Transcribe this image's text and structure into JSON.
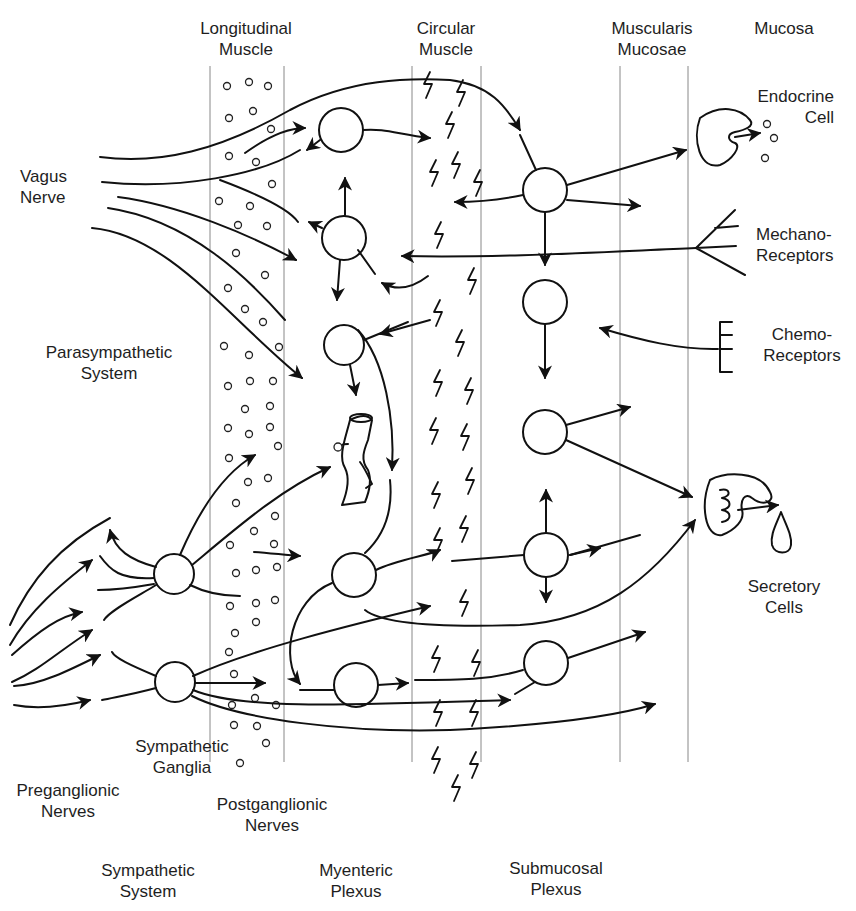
{
  "diagram": {
    "layers": [
      {
        "id": "longitudinal",
        "label_line1": "Longitudinal",
        "label_line2": "Muscle"
      },
      {
        "id": "circular",
        "label_line1": "Circular",
        "label_line2": "Muscle"
      },
      {
        "id": "muscularis",
        "label_line1": "Muscularis",
        "label_line2": "Mucosae"
      },
      {
        "id": "mucosa",
        "label_line1": "Mucosa",
        "label_line2": ""
      }
    ],
    "labels": {
      "vagus": {
        "line1": "Vagus",
        "line2": "Nerve"
      },
      "parasympathetic": {
        "line1": "Parasympathetic",
        "line2": "System"
      },
      "endocrine": {
        "line1": "Endocrine",
        "line2": "Cell"
      },
      "mechano": {
        "line1": "Mechano-",
        "line2": "Receptors"
      },
      "chemo": {
        "line1": "Chemo-",
        "line2": "Receptors"
      },
      "secretory": {
        "line1": "Secretory",
        "line2": "Cells"
      },
      "sympathetic_ganglia": {
        "line1": "Sympathetic",
        "line2": "Ganglia"
      },
      "preganglionic": {
        "line1": "Preganglionic",
        "line2": "Nerves"
      },
      "postganglionic": {
        "line1": "Postganglionic",
        "line2": "Nerves"
      },
      "sympathetic_system": {
        "line1": "Sympathetic",
        "line2": "System"
      },
      "myenteric": {
        "line1": "Myenteric",
        "line2": "Plexus"
      },
      "submucosal": {
        "line1": "Submucosal",
        "line2": "Plexus"
      }
    },
    "colors": {
      "line": "#111111",
      "layer_boundary": "#888888",
      "background": "#ffffff"
    }
  }
}
